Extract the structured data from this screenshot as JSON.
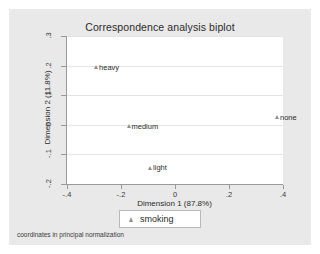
{
  "chart_data": {
    "type": "scatter",
    "title": "Correspondence analysis biplot",
    "xlabel": "Dimension 1 (87.8%)",
    "ylabel": "Dimension 2 (11.8%)",
    "xlim": [
      -0.4,
      0.4
    ],
    "ylim": [
      -0.2,
      0.3
    ],
    "xticks": [
      "-.4",
      "-.2",
      "0",
      ".2",
      ".4"
    ],
    "xtick_values": [
      -0.4,
      -0.2,
      0,
      0.2,
      0.4
    ],
    "yticks": [
      ".3",
      ".2",
      ".1",
      "0",
      "-.1",
      "-.2"
    ],
    "ytick_values": [
      0.3,
      0.2,
      0.1,
      0,
      -0.1,
      -0.2
    ],
    "grid": "horizontal",
    "legend_position": "below-axis",
    "marker": "triangle",
    "marker_color": "#8f8f8f",
    "series": [
      {
        "name": "smoking",
        "points": [
          {
            "label": "heavy",
            "x": -0.29,
            "y": 0.2
          },
          {
            "label": "medium",
            "x": -0.17,
            "y": 0.0
          },
          {
            "label": "light",
            "x": -0.09,
            "y": -0.14
          },
          {
            "label": "none",
            "x": 0.38,
            "y": 0.03
          }
        ]
      }
    ],
    "note": "coordinates in principal normalization"
  },
  "legend": {
    "label": "smoking"
  },
  "footnote": {
    "text": "coordinates in principal normalization"
  },
  "colors": {
    "page_background": "#ffffff",
    "graph_background": "#e9e9e9",
    "plot_background": "#ffffff",
    "axis": "#9a9a9a",
    "gridline": "#e4e4e4",
    "text": "#2b2b2b"
  }
}
